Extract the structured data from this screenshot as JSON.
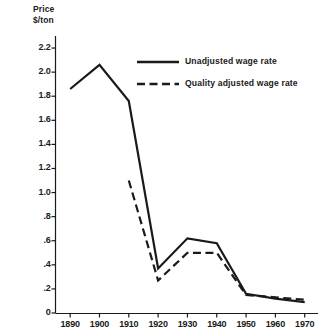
{
  "chart_data": {
    "type": "line",
    "title": "",
    "ylabel": "Price\n$/ton",
    "ylabel_line1": "Price",
    "ylabel_line2": "$/ton",
    "xlabel": "",
    "x": [
      1890,
      1900,
      1910,
      1920,
      1930,
      1940,
      1950,
      1960,
      1970
    ],
    "xtick_labels": [
      "1890",
      "1900",
      "1910",
      "1920",
      "1930",
      "1940",
      "1950",
      "1960",
      "1970"
    ],
    "ytick_labels": [
      "2.2",
      "2.0",
      "1.8",
      "1.6",
      "1.4",
      "1.2",
      "1.0",
      ".8",
      ".6",
      ".4",
      ".2",
      "0"
    ],
    "ytick_values": [
      2.2,
      2.0,
      1.8,
      1.6,
      1.4,
      1.2,
      1.0,
      0.8,
      0.6,
      0.4,
      0.2,
      0
    ],
    "xlim": [
      1885,
      1973
    ],
    "ylim": [
      0,
      2.3
    ],
    "grid": false,
    "legend_position": "upper-right",
    "series": [
      {
        "name": "Unadjusted wage rate",
        "style": "solid",
        "color": "#1a1a1a",
        "x": [
          1890,
          1900,
          1910,
          1920,
          1930,
          1940,
          1950,
          1960,
          1970
        ],
        "values": [
          1.86,
          2.06,
          1.76,
          0.37,
          0.62,
          0.58,
          0.16,
          0.12,
          0.09
        ]
      },
      {
        "name": "Quality adjusted wage rate",
        "style": "dashed",
        "color": "#1a1a1a",
        "x": [
          1910,
          1920,
          1930,
          1940,
          1950,
          1960,
          1970
        ],
        "values": [
          1.1,
          0.27,
          0.5,
          0.5,
          0.15,
          0.13,
          0.11
        ]
      }
    ]
  },
  "legend": {
    "items": [
      {
        "label": "Unadjusted wage rate",
        "style": "solid"
      },
      {
        "label": "Quality adjusted wage rate",
        "style": "dashed"
      }
    ]
  }
}
